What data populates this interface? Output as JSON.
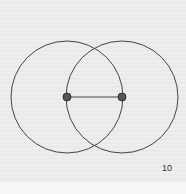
{
  "figure": {
    "number_label": "10",
    "circles": [
      {
        "cx": 67,
        "cy": 97,
        "r": 56
      },
      {
        "cx": 122,
        "cy": 97,
        "r": 56
      }
    ],
    "points": [
      {
        "cx": 67,
        "cy": 97
      },
      {
        "cx": 122,
        "cy": 97
      }
    ],
    "segment": {
      "x1": 67,
      "y1": 97,
      "x2": 122,
      "y2": 97
    },
    "stroke_color": "#444444",
    "point_color": "#555555"
  }
}
